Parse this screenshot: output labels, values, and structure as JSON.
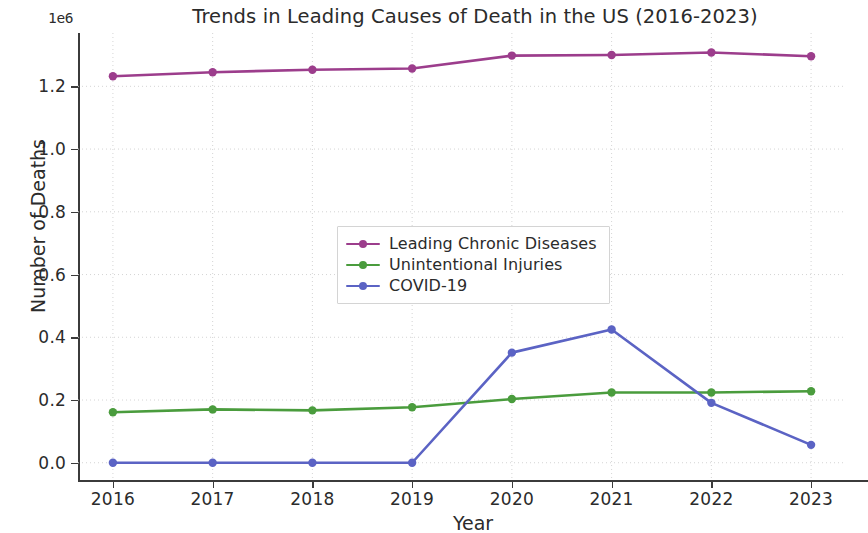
{
  "chart_data": {
    "type": "line",
    "title": "Trends in Leading Causes of Death in the US (2016-2023)",
    "xlabel": "Year",
    "ylabel": "Number of Deaths",
    "offset_text": "1e6",
    "x": [
      2016,
      2017,
      2018,
      2019,
      2020,
      2021,
      2022,
      2023
    ],
    "categories": [
      "2016",
      "2017",
      "2018",
      "2019",
      "2020",
      "2021",
      "2022",
      "2023"
    ],
    "xtick_labels": [
      "2016",
      "2017",
      "2018",
      "2019",
      "2020",
      "2021",
      "2022",
      "2023"
    ],
    "ytick_labels": [
      "0.0",
      "0.2",
      "0.4",
      "0.6",
      "0.8",
      "1.0",
      "1.2"
    ],
    "ytick_values": [
      0,
      200000,
      400000,
      600000,
      800000,
      1000000,
      1200000
    ],
    "xlim": [
      2015.65,
      2023.35
    ],
    "ylim": [
      -55000,
      1370000
    ],
    "grid": true,
    "grid_style": "dotted",
    "legend_position": "center",
    "series": [
      {
        "name": "Leading Chronic Diseases",
        "color": "#9c3d8c",
        "values": [
          1232000,
          1245000,
          1253000,
          1257000,
          1298000,
          1300000,
          1308000,
          1296000
        ]
      },
      {
        "name": "Unintentional Injuries",
        "color": "#4a9c3d",
        "values": [
          161000,
          170000,
          167000,
          177000,
          203000,
          224000,
          224000,
          228000
        ]
      },
      {
        "name": "COVID-19",
        "color": "#5b63c4",
        "values": [
          0,
          0,
          0,
          0,
          351000,
          425000,
          191000,
          57000
        ]
      }
    ]
  }
}
